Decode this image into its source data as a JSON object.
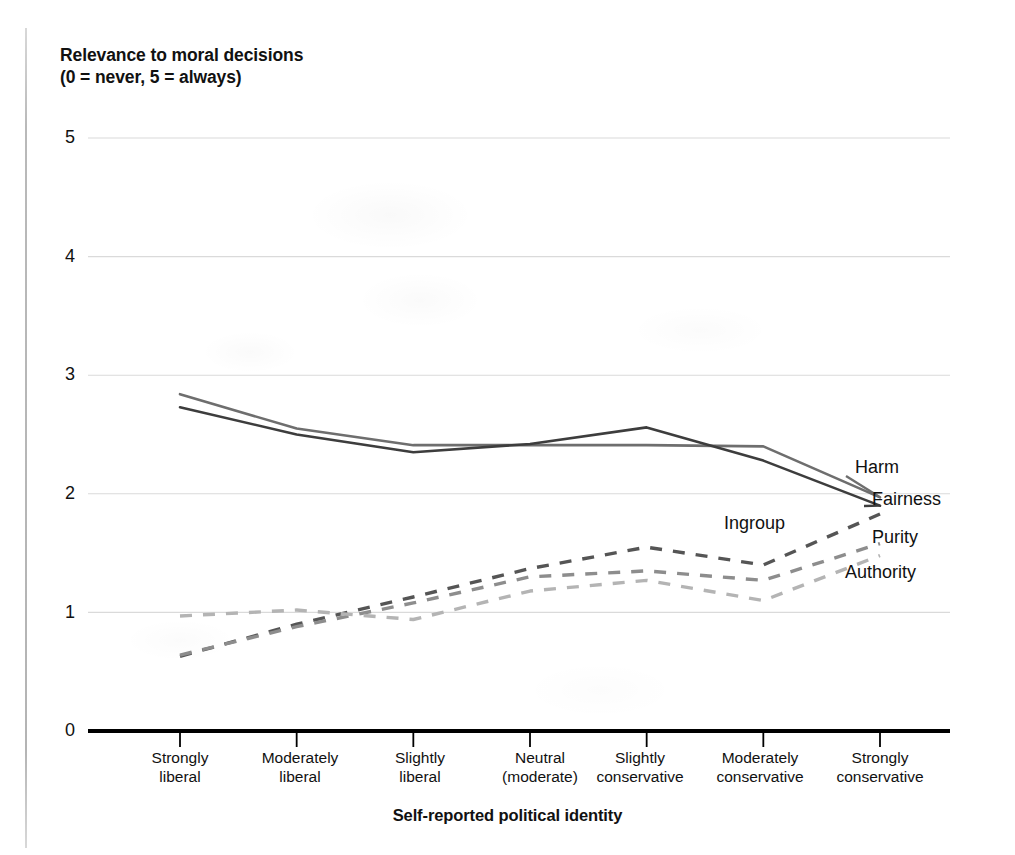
{
  "chart_data": {
    "type": "line",
    "title": "Relevance to moral decisions\n(0 = never, 5 = always)",
    "xlabel": "Self-reported political identity",
    "ylabel": "Relevance to moral decisions (0 = never, 5 = always)",
    "ylim": [
      0,
      5
    ],
    "yticks": [
      0,
      1,
      2,
      3,
      4,
      5
    ],
    "grid": "horizontal",
    "legend_position": "right-inline",
    "categories": [
      "Strongly\nliberal",
      "Moderately\nliberal",
      "Slightly\nliberal",
      "Neutral\n(moderate)",
      "Slightly\nconservative",
      "Moderately\nconservative",
      "Strongly\nconservative"
    ],
    "series": [
      {
        "name": "Harm",
        "style": "solid",
        "color": "#6e6e6e",
        "values": [
          2.84,
          2.55,
          2.41,
          2.41,
          2.41,
          2.4,
          1.97
        ]
      },
      {
        "name": "Fairness",
        "style": "solid",
        "color": "#3d3d3d",
        "values": [
          2.73,
          2.5,
          2.35,
          2.42,
          2.56,
          2.28,
          1.9
        ]
      },
      {
        "name": "Ingroup",
        "style": "dashed",
        "color": "#555555",
        "values": [
          0.63,
          0.9,
          1.13,
          1.37,
          1.55,
          1.4,
          1.83
        ]
      },
      {
        "name": "Purity",
        "style": "dashed",
        "color": "#8d8d8d",
        "values": [
          0.64,
          0.88,
          1.08,
          1.3,
          1.35,
          1.27,
          1.58
        ]
      },
      {
        "name": "Authority",
        "style": "dashed",
        "color": "#b4b4b4",
        "values": [
          0.97,
          1.02,
          0.94,
          1.18,
          1.27,
          1.1,
          1.48
        ]
      }
    ],
    "legend_entries": [
      {
        "label": "Harm",
        "x": 855,
        "y": 468
      },
      {
        "label": "Fairness",
        "x": 872,
        "y": 500
      },
      {
        "label": "Ingroup",
        "x": 724,
        "y": 524
      },
      {
        "label": "Purity",
        "x": 872,
        "y": 538
      },
      {
        "label": "Authority",
        "x": 845,
        "y": 573
      }
    ],
    "axis_color": "#000000",
    "grid_color": "#dadada"
  }
}
